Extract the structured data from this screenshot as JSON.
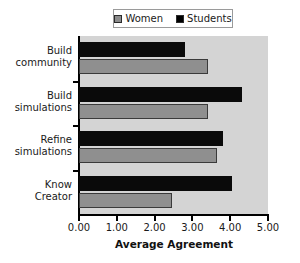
{
  "chart_data": {
    "type": "bar",
    "orientation": "horizontal",
    "title": "",
    "xlabel": "Average Agreement",
    "ylabel": "",
    "xlim": [
      0,
      5
    ],
    "xticks": [
      "0.00",
      "1.00",
      "2.00",
      "3.00",
      "4.00",
      "5.00"
    ],
    "xtick_values": [
      0,
      1,
      2,
      3,
      4,
      5
    ],
    "grid": false,
    "legend_position": "top-center",
    "categories": [
      "Build community",
      "Build simulations",
      "Refine simulations",
      "Know Creator"
    ],
    "series": [
      {
        "name": "Students",
        "color": "#0a0a0a",
        "values": [
          2.8,
          4.3,
          3.8,
          4.05
        ]
      },
      {
        "name": "Women",
        "color": "#8f8f8f",
        "values": [
          3.4,
          3.4,
          3.65,
          2.45
        ]
      }
    ]
  },
  "legend": {
    "entries": [
      {
        "label": "Women",
        "swatch": "women-swatch-icon"
      },
      {
        "label": "Students",
        "swatch": "students-swatch-icon"
      }
    ]
  },
  "axes": {
    "x_title": "Average Agreement",
    "x_tick_labels": [
      "0.00",
      "1.00",
      "2.00",
      "3.00",
      "4.00",
      "5.00"
    ],
    "y_tick_labels": [
      "Build community",
      "Build simulations",
      "Refine simulations",
      "Know Creator"
    ]
  },
  "colors": {
    "plot_background": "#d4d4d4",
    "page_background": "#ffffff",
    "axis": "#000000",
    "students_bar": "#0a0a0a",
    "women_bar": "#8f8f8f",
    "bar_border": "#3a3a3a",
    "legend_border": "#9a9a9a"
  }
}
